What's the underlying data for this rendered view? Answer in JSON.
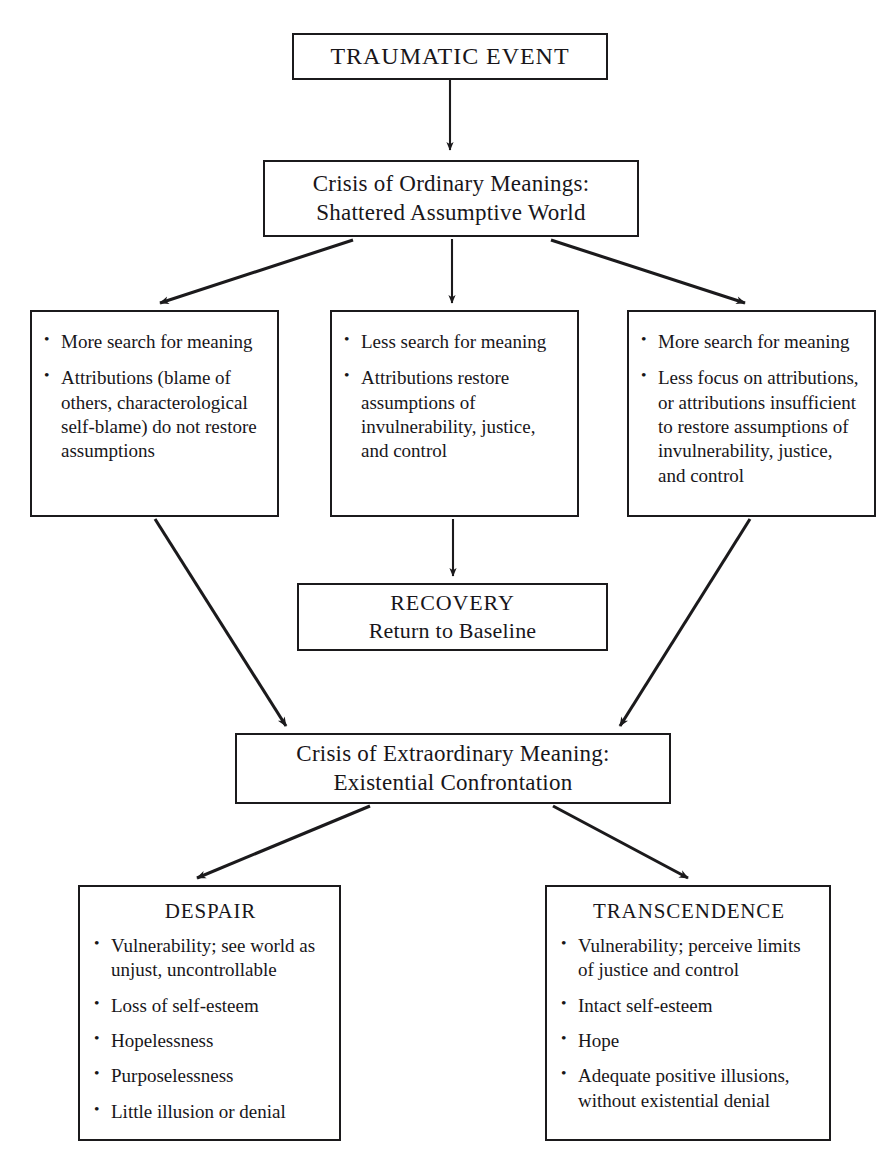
{
  "diagram": {
    "line_color": "#1b1a1c",
    "background_color": "#ffffff",
    "nodes": {
      "traumatic_event": {
        "label": "TRAUMATIC EVENT"
      },
      "crisis_ordinary": {
        "line1": "Crisis of Ordinary Meanings:",
        "line2": "Shattered Assumptive World"
      },
      "branch_left": {
        "bullets": [
          "More search for meaning",
          "Attributions (blame of others, characterological self-blame) do not restore assumptions"
        ]
      },
      "branch_middle": {
        "bullets": [
          "Less search for meaning",
          "Attributions restore assumptions of invulnerability, justice, and control"
        ]
      },
      "branch_right": {
        "bullets": [
          "More search for meaning",
          "Less focus on attributions, or attributions insufficient to restore assumptions of invulnerability, justice, and control"
        ]
      },
      "recovery": {
        "line1": "RECOVERY",
        "line2": "Return to Baseline"
      },
      "crisis_extraordinary": {
        "line1": "Crisis of Extraordinary Meaning:",
        "line2": "Existential Confrontation"
      },
      "despair": {
        "title": "DESPAIR",
        "bullets": [
          "Vulnerability; see world as unjust, uncontrollable",
          "Loss of self-esteem",
          "Hopelessness",
          "Purposelessness",
          "Little illusion or denial"
        ]
      },
      "transcendence": {
        "title": "TRANSCENDENCE",
        "bullets": [
          "Vulnerability; perceive limits of justice and control",
          "Intact self-esteem",
          "Hope",
          "Adequate positive illusions, without existential denial"
        ]
      }
    },
    "edges": [
      {
        "name": "edge-traumatic-to-crisis",
        "from": "traumatic_event",
        "to": "crisis_ordinary",
        "style": "straight-vertical"
      },
      {
        "name": "edge-crisis-to-left",
        "from": "crisis_ordinary",
        "to": "branch_left",
        "style": "diagonal"
      },
      {
        "name": "edge-crisis-to-middle",
        "from": "crisis_ordinary",
        "to": "branch_middle",
        "style": "straight-vertical"
      },
      {
        "name": "edge-crisis-to-right",
        "from": "crisis_ordinary",
        "to": "branch_right",
        "style": "diagonal"
      },
      {
        "name": "edge-middle-to-recovery",
        "from": "branch_middle",
        "to": "recovery",
        "style": "straight-vertical"
      },
      {
        "name": "edge-left-to-extraordinary",
        "from": "branch_left",
        "to": "crisis_extraordinary",
        "style": "diagonal"
      },
      {
        "name": "edge-right-to-extraordinary",
        "from": "branch_right",
        "to": "crisis_extraordinary",
        "style": "diagonal"
      },
      {
        "name": "edge-extraordinary-to-despair",
        "from": "crisis_extraordinary",
        "to": "despair",
        "style": "diagonal"
      },
      {
        "name": "edge-extraordinary-to-transcendence",
        "from": "crisis_extraordinary",
        "to": "transcendence",
        "style": "diagonal"
      }
    ]
  }
}
